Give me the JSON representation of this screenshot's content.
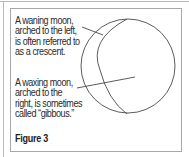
{
  "figure": {
    "captions": {
      "waning": "A waning moon,\narched to the left,\nis often referred to\nas a crescent.",
      "waxing": "A waxing moon,\narched to the\nright, is sometimes\ncalled “gibbous.”"
    },
    "label": "Figure 3",
    "colors": {
      "stroke": "#4a4a4a",
      "border": "#a8a8a8",
      "text": "#2a2a2a"
    },
    "moon": {
      "outer_circle": {
        "cx": 128,
        "cy": 66,
        "r": 47
      },
      "inner_arc": {
        "top": [
          127,
          19
        ],
        "mid_x": 100,
        "bottom": [
          127,
          114
        ]
      },
      "leader_waning": {
        "from": [
          82,
          27
        ],
        "to": [
          103,
          35
        ]
      },
      "leader_waxing": {
        "from": [
          77,
          88
        ],
        "to": [
          135,
          77
        ]
      }
    }
  }
}
